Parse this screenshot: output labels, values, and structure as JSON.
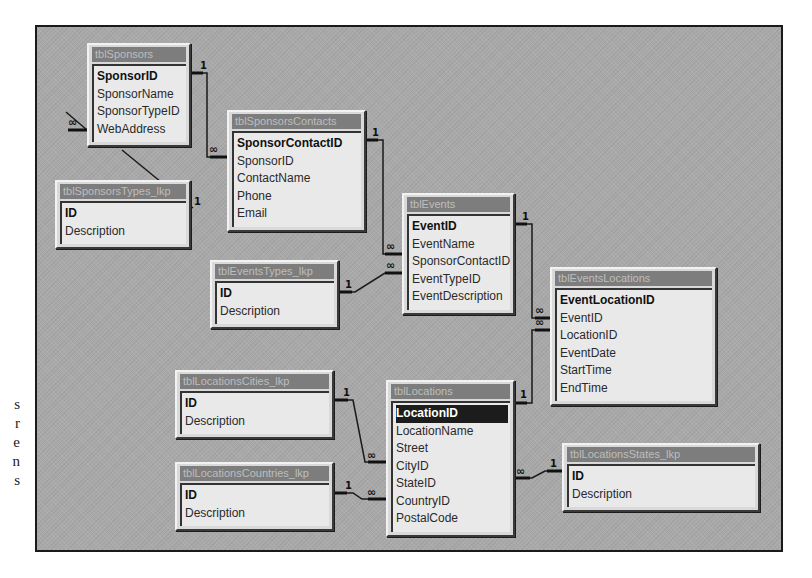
{
  "margin_text": [
    "s",
    "r",
    "e",
    "n",
    "s"
  ],
  "colors": {
    "canvas_bg": "#a9a9a9",
    "title_bar": "#7d7d7d",
    "title_text": "#bdbdbd",
    "field_bg": "#e9e9e9",
    "selected_row": "#1c1c1c"
  },
  "tables": [
    {
      "id": "tblSponsors",
      "title": "tblSponsors",
      "fields": [
        {
          "name": "SponsorID",
          "pk": true
        },
        {
          "name": "SponsorName"
        },
        {
          "name": "SponsorTypeID"
        },
        {
          "name": "WebAddress"
        }
      ]
    },
    {
      "id": "tblSponsorsContacts",
      "title": "tblSponsorsContacts",
      "fields": [
        {
          "name": "SponsorContactID",
          "pk": true
        },
        {
          "name": "SponsorID"
        },
        {
          "name": "ContactName"
        },
        {
          "name": "Phone"
        },
        {
          "name": "Email"
        }
      ]
    },
    {
      "id": "tblSponsorsTypes_lkp",
      "title": "tblSponsorsTypes_lkp",
      "fields": [
        {
          "name": "ID",
          "pk": true
        },
        {
          "name": "Description"
        }
      ]
    },
    {
      "id": "tblEvents",
      "title": "tblEvents",
      "fields": [
        {
          "name": "EventID",
          "pk": true
        },
        {
          "name": "EventName"
        },
        {
          "name": "SponsorContactID"
        },
        {
          "name": "EventTypeID"
        },
        {
          "name": "EventDescription"
        }
      ]
    },
    {
      "id": "tblEventsTypes_lkp",
      "title": "tblEventsTypes_lkp",
      "fields": [
        {
          "name": "ID",
          "pk": true
        },
        {
          "name": "Description"
        }
      ]
    },
    {
      "id": "tblEventsLocations",
      "title": "tblEventsLocations",
      "fields": [
        {
          "name": "EventLocationID",
          "pk": true
        },
        {
          "name": "EventID"
        },
        {
          "name": "LocationID"
        },
        {
          "name": "EventDate"
        },
        {
          "name": "StartTime"
        },
        {
          "name": "EndTime"
        }
      ]
    },
    {
      "id": "tblLocationsCities_lkp",
      "title": "tblLocationsCities_lkp",
      "fields": [
        {
          "name": "ID",
          "pk": true
        },
        {
          "name": "Description"
        }
      ]
    },
    {
      "id": "tblLocations",
      "title": "tblLocations",
      "fields": [
        {
          "name": "LocationID",
          "pk": true,
          "selected": true
        },
        {
          "name": "LocationName"
        },
        {
          "name": "Street"
        },
        {
          "name": "CityID"
        },
        {
          "name": "StateID"
        },
        {
          "name": "CountryID"
        },
        {
          "name": "PostalCode"
        }
      ]
    },
    {
      "id": "tblLocationsCountries_lkp",
      "title": "tblLocationsCountries_lkp",
      "fields": [
        {
          "name": "ID",
          "pk": true
        },
        {
          "name": "Description"
        }
      ]
    },
    {
      "id": "tblLocationsStates_lkp",
      "title": "tblLocationsStates_lkp",
      "fields": [
        {
          "name": "ID",
          "pk": true
        },
        {
          "name": "Description"
        }
      ]
    }
  ],
  "relationships": [
    {
      "from": "tblSponsors.SponsorID",
      "to": "tblSponsorsContacts.SponsorID",
      "one": "1",
      "many": "∞"
    },
    {
      "from": "tblSponsorsTypes_lkp.ID",
      "to": "tblSponsors.SponsorTypeID",
      "one": "1",
      "many": "∞"
    },
    {
      "from": "tblSponsorsContacts.SponsorContactID",
      "to": "tblEvents.SponsorContactID",
      "one": "1",
      "many": "∞"
    },
    {
      "from": "tblEventsTypes_lkp.ID",
      "to": "tblEvents.EventTypeID",
      "one": "1",
      "many": "∞"
    },
    {
      "from": "tblEvents.EventID",
      "to": "tblEventsLocations.EventID",
      "one": "1",
      "many": "∞"
    },
    {
      "from": "tblLocations.LocationID",
      "to": "tblEventsLocations.LocationID",
      "one": "1",
      "many": "∞"
    },
    {
      "from": "tblLocationsCities_lkp.ID",
      "to": "tblLocations.CityID",
      "one": "1",
      "many": "∞"
    },
    {
      "from": "tblLocationsCountries_lkp.ID",
      "to": "tblLocations.CountryID",
      "one": "1",
      "many": "∞"
    },
    {
      "from": "tblLocationsStates_lkp.ID",
      "to": "tblLocations.StateID",
      "one": "1",
      "many": "∞"
    }
  ],
  "labels": {
    "one": "1",
    "many": "∞"
  }
}
